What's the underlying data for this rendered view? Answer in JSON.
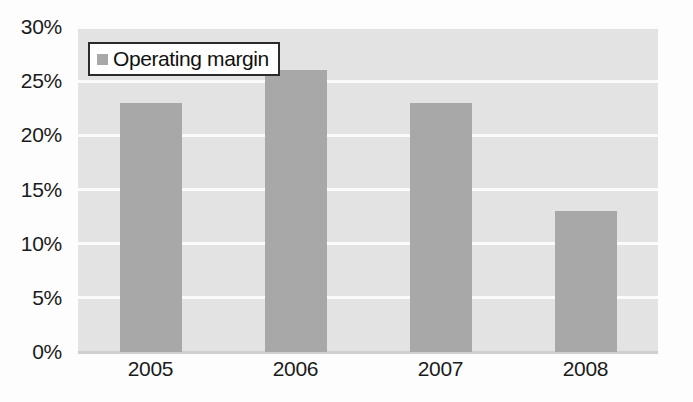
{
  "chart_data": {
    "type": "bar",
    "title": "",
    "subtitle": "",
    "xlabel": "",
    "ylabel": "",
    "categories": [
      "2005",
      "2006",
      "2007",
      "2008"
    ],
    "series": [
      {
        "name": "Operating margin",
        "values": [
          23,
          26,
          23,
          13
        ]
      }
    ],
    "values": [
      23,
      26,
      23,
      13
    ],
    "ylim": [
      0,
      30
    ],
    "ytick_values": [
      0,
      5,
      10,
      15,
      20,
      25,
      30
    ],
    "ytick_labels": [
      "0%",
      "5%",
      "10%",
      "15%",
      "20%",
      "25%",
      "30%"
    ],
    "value_suffix": "%",
    "grid": true,
    "grid_axis": "y",
    "legend_position": "top-left-inside",
    "legend_entries": [
      "Operating margin"
    ],
    "annotations": []
  },
  "legend": {
    "label": "Operating margin",
    "swatch_name": "legend-color-swatch"
  },
  "colors": {
    "bar": "#a8a8a8",
    "plot_background": "#e3e3e3",
    "gridline": "#fbfbfb",
    "baseline": "#cfcfcf",
    "text": "#1b1b1b",
    "legend_border": "#2b2b2b",
    "legend_background": "#ffffff",
    "canvas_background": "#fdfdfd"
  }
}
